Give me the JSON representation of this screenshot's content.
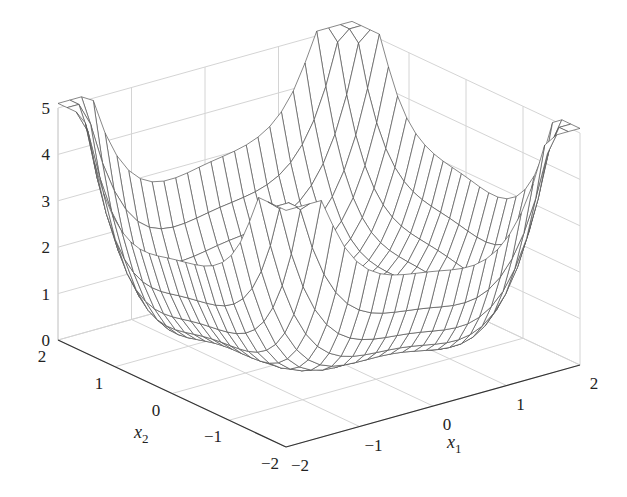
{
  "chart_data": {
    "type": "surface-mesh",
    "title": "",
    "xlabel": "x1",
    "ylabel": "x2",
    "zlabel": "",
    "xlim": [
      -2,
      2
    ],
    "ylim": [
      -2,
      2
    ],
    "zlim": [
      0,
      5
    ],
    "x_ticks": [
      "-2",
      "-1",
      "0",
      "1",
      "2"
    ],
    "y_ticks": [
      "-2",
      "-1",
      "0",
      "1",
      "2"
    ],
    "z_ticks": [
      "0",
      "1",
      "2",
      "3",
      "4",
      "5"
    ],
    "grid": true,
    "grid_resolution": 25,
    "corner_values": {
      "(-2,2)": 4.3,
      "(2,2)": 5.0,
      "(2,-2)": 4.3,
      "(-2,-2)": 4.8
    },
    "min_value_approx": 0.2,
    "center_value_approx": 1.0
  },
  "labels": {
    "x1": "x",
    "x1_sub": "1",
    "x2": "x",
    "x2_sub": "2"
  },
  "colors": {
    "mesh": "#555555",
    "grid": "#d4d4d4",
    "axis": "#333333",
    "background": "#ffffff"
  }
}
